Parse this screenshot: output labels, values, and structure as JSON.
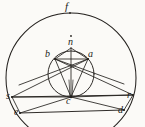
{
  "figure": {
    "kind": "geometric-construction-diagram",
    "ink_color": "#1b1a18",
    "paper_color": "#fbfaf7",
    "canvas": {
      "width": 145,
      "height": 127
    },
    "labels": {
      "f": "f",
      "n": "n",
      "b": "b",
      "a": "a",
      "s": "s",
      "c": "c",
      "r": "r",
      "e": "e",
      "d": "d"
    },
    "points": [
      {
        "id": "f",
        "label": "f",
        "x": 70,
        "y": 13,
        "role": "outer-circle-top-marker"
      },
      {
        "id": "n",
        "label": "n",
        "x": 71,
        "y": 48,
        "role": "apex-of-inner-triangle"
      },
      {
        "id": "b",
        "label": "b",
        "x": 55,
        "y": 59,
        "role": "left-vertex-of-inner-quad"
      },
      {
        "id": "a",
        "label": "a",
        "x": 88,
        "y": 59,
        "role": "right-vertex-of-inner-quad"
      },
      {
        "id": "s",
        "label": "s",
        "x": 15,
        "y": 97,
        "role": "left-baseline-vertex"
      },
      {
        "id": "c",
        "label": "c",
        "x": 71,
        "y": 97,
        "role": "centre-point"
      },
      {
        "id": "r",
        "label": "r",
        "x": 130,
        "y": 95,
        "role": "right-baseline-vertex"
      },
      {
        "id": "e",
        "label": "e",
        "x": 22,
        "y": 112,
        "role": "lower-left-vertex"
      },
      {
        "id": "d",
        "label": "d",
        "x": 122,
        "y": 110,
        "role": "lower-right-vertex"
      }
    ],
    "circles": [
      {
        "id": "outer-circle",
        "label": "f",
        "cx": 71,
        "cy": 78,
        "r": 65
      },
      {
        "id": "inner-circle",
        "label": "",
        "cx": 71,
        "cy": 74,
        "r": 23
      }
    ],
    "segments": [
      {
        "from": "s",
        "to": "r"
      },
      {
        "from": "e",
        "to": "d"
      },
      {
        "from": "s",
        "to": "e"
      },
      {
        "from": "r",
        "to": "d"
      },
      {
        "from": "s",
        "to": "a"
      },
      {
        "from": "r",
        "to": "b"
      },
      {
        "from": "b",
        "to": "a"
      },
      {
        "from": "b",
        "to": "n"
      },
      {
        "from": "a",
        "to": "n"
      },
      {
        "from": "b",
        "to": "c"
      },
      {
        "from": "a",
        "to": "c"
      },
      {
        "from": "n",
        "to": "c"
      },
      {
        "from": "s",
        "to": "c"
      },
      {
        "from": "r",
        "to": "c"
      },
      {
        "from": "e",
        "to": "c"
      },
      {
        "from": "d",
        "to": "c"
      }
    ]
  }
}
